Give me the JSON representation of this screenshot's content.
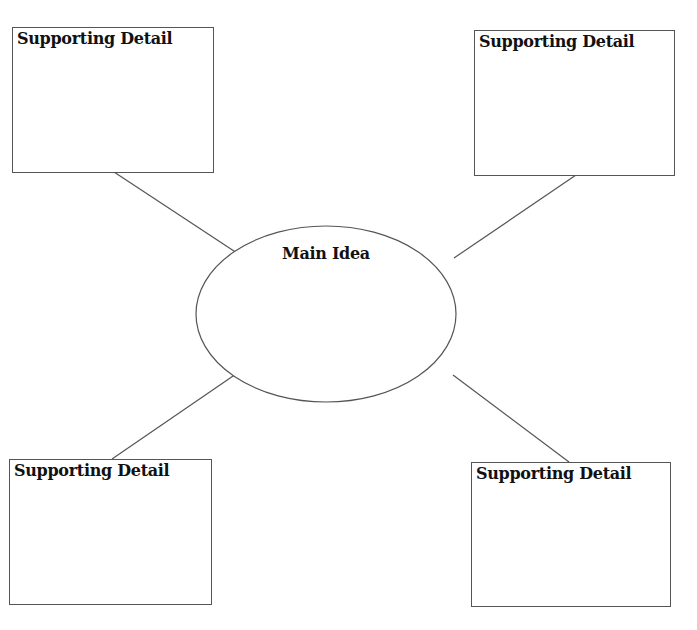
{
  "diagram": {
    "type": "main-idea-web",
    "center": {
      "label": "Main Idea"
    },
    "boxes": [
      {
        "position": "top-left",
        "label": "Supporting Detail"
      },
      {
        "position": "top-right",
        "label": "Supporting Detail"
      },
      {
        "position": "bottom-left",
        "label": "Supporting Detail"
      },
      {
        "position": "bottom-right",
        "label": "Supporting Detail"
      }
    ],
    "colors": {
      "stroke": "#555555",
      "text": "#111111",
      "background": "#ffffff"
    }
  }
}
